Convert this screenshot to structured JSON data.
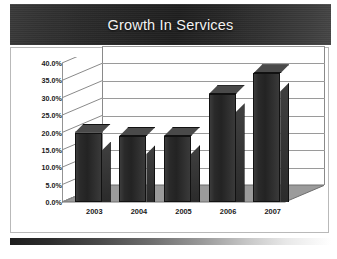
{
  "slide": {
    "title": "Growth In Services"
  },
  "chart_data": {
    "type": "bar",
    "title": "Growth In Services",
    "xlabel": "",
    "ylabel": "",
    "categories": [
      "2003",
      "2004",
      "2005",
      "2006",
      "2007"
    ],
    "values": [
      20.0,
      19.0,
      19.0,
      31.0,
      37.0
    ],
    "value_labels": [
      "20.0%",
      "19.0%",
      "19.0%",
      "31.0%",
      "37.0%"
    ],
    "ylim": [
      0,
      40
    ],
    "ytick_values": [
      0,
      5,
      10,
      15,
      20,
      25,
      30,
      35,
      40
    ],
    "ytick_labels": [
      "0.0%",
      "5.0%",
      "10.0%",
      "15.0%",
      "20.0%",
      "25.0%",
      "30.0%",
      "35.0%",
      "40.0%"
    ],
    "grid": true,
    "legend": false,
    "style": "3d-column",
    "series_color": "#2a2a2a",
    "floor_color": "#9b9b9b",
    "gridline_color": "#9a9a9a"
  },
  "theme": {
    "title_band_color": "#262626",
    "title_text_color": "#f2f2f2",
    "background": "#ffffff",
    "border_color": "#b9b9b9"
  }
}
